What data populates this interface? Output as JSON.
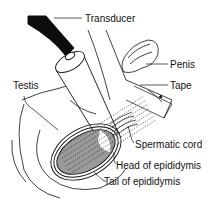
{
  "diagram": {
    "labels": {
      "transducer": "Transducer",
      "penis": "Penis",
      "tape": "Tape",
      "testis": "Testis",
      "spermatic_cord": "Spermatic cord",
      "head_of_epididymis": "Head of epididymis",
      "tail_of_epididymis": "Tail of epididymis"
    },
    "colors": {
      "line": "#111111",
      "cable": "#0d0d0d",
      "testis_fill": "#9a9a9a",
      "background": "#ffffff"
    }
  }
}
